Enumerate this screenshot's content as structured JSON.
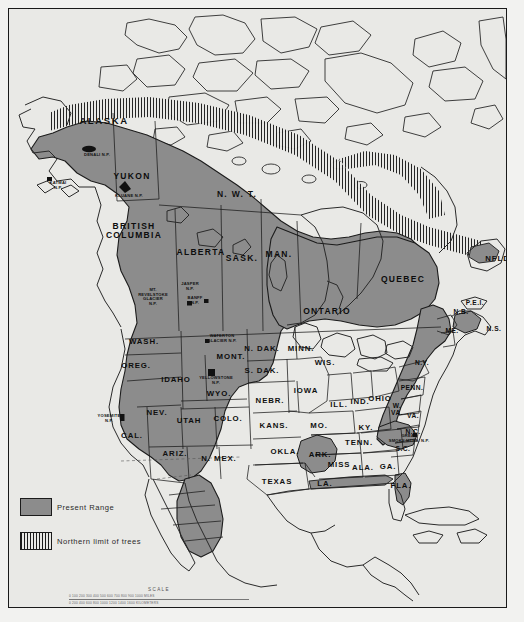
{
  "map": {
    "title": "Present Range and Northern limit of trees — North America",
    "background_color": "#e9e9e6",
    "range_fill_color": "#8c8c8c",
    "outline_color": "#1a1a1a",
    "frame_color": "#1a1a1a"
  },
  "legend": {
    "present_range_label": "Present Range",
    "northern_limit_label": "Northern limit of trees"
  },
  "scale": {
    "title": "SCALE",
    "row_miles": "0   100   200   300   400   500   600   700   800   900  1000 MILES",
    "row_km": "0      200     400     600     800    1000    1200   1400  1600 KILOMETERS"
  },
  "labels": {
    "provinces": [
      {
        "id": "alaska",
        "text": "ALASKA",
        "x": 95,
        "y": 112,
        "size": "s-big",
        "tone": "ondark"
      },
      {
        "id": "yukon",
        "text": "YUKON",
        "x": 123,
        "y": 167,
        "size": "s-prov",
        "tone": "ondark"
      },
      {
        "id": "nwt",
        "text": "N. W. T.",
        "x": 228,
        "y": 185,
        "size": "s-prov",
        "tone": "onlight"
      },
      {
        "id": "british-columbia",
        "text": "BRITISH\nCOLUMBIA",
        "x": 125,
        "y": 222,
        "size": "s-prov",
        "tone": "ondark"
      },
      {
        "id": "alberta",
        "text": "ALBERTA",
        "x": 192,
        "y": 243,
        "size": "s-prov",
        "tone": "ondark"
      },
      {
        "id": "sask",
        "text": "SASK.",
        "x": 233,
        "y": 249,
        "size": "s-prov",
        "tone": "ondark"
      },
      {
        "id": "man",
        "text": "MAN.",
        "x": 270,
        "y": 245,
        "size": "s-prov",
        "tone": "ondark"
      },
      {
        "id": "ontario",
        "text": "ONTARIO",
        "x": 318,
        "y": 302,
        "size": "s-prov",
        "tone": "ondark"
      },
      {
        "id": "quebec",
        "text": "QUEBEC",
        "x": 394,
        "y": 270,
        "size": "s-prov",
        "tone": "ondark"
      },
      {
        "id": "nfld",
        "text": "NFLD.",
        "x": 490,
        "y": 250,
        "size": "s-st",
        "tone": "onlight"
      },
      {
        "id": "pei",
        "text": "P.E.I.",
        "x": 466,
        "y": 294,
        "size": "s-sm",
        "tone": "onlight"
      },
      {
        "id": "nb",
        "text": "N.B.",
        "x": 452,
        "y": 303,
        "size": "s-sm",
        "tone": "ondark"
      },
      {
        "id": "ns",
        "text": "N.S.",
        "x": 485,
        "y": 320,
        "size": "s-sm",
        "tone": "onlight"
      },
      {
        "id": "me",
        "text": "ME.",
        "x": 443,
        "y": 322,
        "size": "s-sm",
        "tone": "ondark"
      }
    ],
    "states": [
      {
        "id": "wash",
        "text": "WASH.",
        "x": 135,
        "y": 333,
        "size": "s-st",
        "tone": "ondark"
      },
      {
        "id": "oreg",
        "text": "OREG.",
        "x": 127,
        "y": 357,
        "size": "s-st",
        "tone": "ondark"
      },
      {
        "id": "idaho",
        "text": "IDAHO",
        "x": 167,
        "y": 371,
        "size": "s-st",
        "tone": "ondark"
      },
      {
        "id": "mont",
        "text": "MONT.",
        "x": 222,
        "y": 348,
        "size": "s-st",
        "tone": "ondark"
      },
      {
        "id": "wyo",
        "text": "WYO.",
        "x": 210,
        "y": 385,
        "size": "s-st",
        "tone": "ondark"
      },
      {
        "id": "nev",
        "text": "NEV.",
        "x": 148,
        "y": 404,
        "size": "s-st",
        "tone": "onlight"
      },
      {
        "id": "utah",
        "text": "UTAH",
        "x": 180,
        "y": 412,
        "size": "s-st",
        "tone": "ondark"
      },
      {
        "id": "colo",
        "text": "COLO.",
        "x": 219,
        "y": 410,
        "size": "s-st",
        "tone": "ondark"
      },
      {
        "id": "cal",
        "text": "CAL.",
        "x": 123,
        "y": 427,
        "size": "s-st",
        "tone": "onlight"
      },
      {
        "id": "ariz",
        "text": "ARIZ.",
        "x": 166,
        "y": 445,
        "size": "s-st",
        "tone": "onlight"
      },
      {
        "id": "nmex",
        "text": "N. MEX.",
        "x": 210,
        "y": 450,
        "size": "s-st",
        "tone": "ondark"
      },
      {
        "id": "ndak",
        "text": "N. DAK.",
        "x": 253,
        "y": 340,
        "size": "s-st",
        "tone": "onlight"
      },
      {
        "id": "sdak",
        "text": "S. DAK.",
        "x": 253,
        "y": 362,
        "size": "s-st",
        "tone": "onlight"
      },
      {
        "id": "nebr",
        "text": "NEBR.",
        "x": 261,
        "y": 392,
        "size": "s-st",
        "tone": "onlight"
      },
      {
        "id": "kans",
        "text": "KANS.",
        "x": 265,
        "y": 417,
        "size": "s-st",
        "tone": "onlight"
      },
      {
        "id": "okla",
        "text": "OKLA.",
        "x": 276,
        "y": 443,
        "size": "s-st",
        "tone": "onlight"
      },
      {
        "id": "texas",
        "text": "TEXAS",
        "x": 268,
        "y": 473,
        "size": "s-st",
        "tone": "onlight"
      },
      {
        "id": "minn",
        "text": "MINN.",
        "x": 292,
        "y": 340,
        "size": "s-st",
        "tone": "onlight"
      },
      {
        "id": "wis",
        "text": "WIS.",
        "x": 316,
        "y": 354,
        "size": "s-st",
        "tone": "onlight"
      },
      {
        "id": "iowa",
        "text": "IOWA",
        "x": 297,
        "y": 382,
        "size": "s-st",
        "tone": "onlight"
      },
      {
        "id": "ill",
        "text": "ILL.",
        "x": 330,
        "y": 396,
        "size": "s-st",
        "tone": "onlight"
      },
      {
        "id": "ind",
        "text": "IND.",
        "x": 351,
        "y": 393,
        "size": "s-st",
        "tone": "onlight"
      },
      {
        "id": "ohio",
        "text": "OHIO",
        "x": 371,
        "y": 390,
        "size": "s-st",
        "tone": "onlight"
      },
      {
        "id": "mo",
        "text": "MO.",
        "x": 310,
        "y": 417,
        "size": "s-st",
        "tone": "onlight"
      },
      {
        "id": "ky",
        "text": "KY.",
        "x": 357,
        "y": 419,
        "size": "s-st",
        "tone": "onlight"
      },
      {
        "id": "tenn",
        "text": "TENN.",
        "x": 350,
        "y": 434,
        "size": "s-st",
        "tone": "onlight"
      },
      {
        "id": "ark",
        "text": "ARK.",
        "x": 311,
        "y": 446,
        "size": "s-st",
        "tone": "ondark"
      },
      {
        "id": "miss",
        "text": "MISS",
        "x": 330,
        "y": 456,
        "size": "s-st",
        "tone": "onlight"
      },
      {
        "id": "ala",
        "text": "ALA.",
        "x": 354,
        "y": 459,
        "size": "s-st",
        "tone": "onlight"
      },
      {
        "id": "ga",
        "text": "GA.",
        "x": 379,
        "y": 458,
        "size": "s-st",
        "tone": "onlight"
      },
      {
        "id": "la",
        "text": "LA.",
        "x": 316,
        "y": 475,
        "size": "s-st",
        "tone": "onlight"
      },
      {
        "id": "fla",
        "text": "FLA.",
        "x": 392,
        "y": 477,
        "size": "s-st",
        "tone": "ondark"
      },
      {
        "id": "ny",
        "text": "N.Y.",
        "x": 413,
        "y": 354,
        "size": "s-sm",
        "tone": "ondark"
      },
      {
        "id": "penn",
        "text": "PENN.",
        "x": 403,
        "y": 379,
        "size": "s-sm",
        "tone": "ondark"
      },
      {
        "id": "wva",
        "text": "W.\nVA.",
        "x": 388,
        "y": 401,
        "size": "s-sm",
        "tone": "ondark"
      },
      {
        "id": "va",
        "text": "VA.",
        "x": 404,
        "y": 407,
        "size": "s-sm",
        "tone": "onlight"
      },
      {
        "id": "nc",
        "text": "N.C.",
        "x": 404,
        "y": 423,
        "size": "s-sm",
        "tone": "ondark"
      },
      {
        "id": "sc",
        "text": "S.C.",
        "x": 394,
        "y": 440,
        "size": "s-sm",
        "tone": "onlight"
      }
    ],
    "parks": [
      {
        "id": "denali",
        "text": "DENALI  N.P.",
        "x": 88,
        "y": 146,
        "size": "s-np"
      },
      {
        "id": "katmai",
        "text": "KATMAI\nN.P.",
        "x": 49,
        "y": 177,
        "size": "s-np"
      },
      {
        "id": "kluane",
        "text": "KLUANE  N.P.",
        "x": 120,
        "y": 187,
        "size": "s-np"
      },
      {
        "id": "revelstoke",
        "text": "MT.\nREVELSTOKE\nGLACIER\nN.P.",
        "x": 144,
        "y": 288,
        "size": "s-np"
      },
      {
        "id": "jasper",
        "text": "JASPER\nN.P.",
        "x": 181,
        "y": 278,
        "size": "s-np"
      },
      {
        "id": "banff",
        "text": "BANFF\nN.P.",
        "x": 186,
        "y": 292,
        "size": "s-np"
      },
      {
        "id": "waterton",
        "text": "WATERTON\nGLACIER  N.P.",
        "x": 213,
        "y": 330,
        "size": "s-np"
      },
      {
        "id": "yellowstone",
        "text": "YELLOWSTONE\nN.P.",
        "x": 207,
        "y": 372,
        "size": "s-np"
      },
      {
        "id": "yosemite",
        "text": "YOSEMITE\nN.P.",
        "x": 100,
        "y": 410,
        "size": "s-np"
      },
      {
        "id": "great-smoky",
        "text": "GREAT\nSMOKY MTNS.  N.P.",
        "x": 400,
        "y": 430,
        "size": "s-np"
      }
    ]
  }
}
